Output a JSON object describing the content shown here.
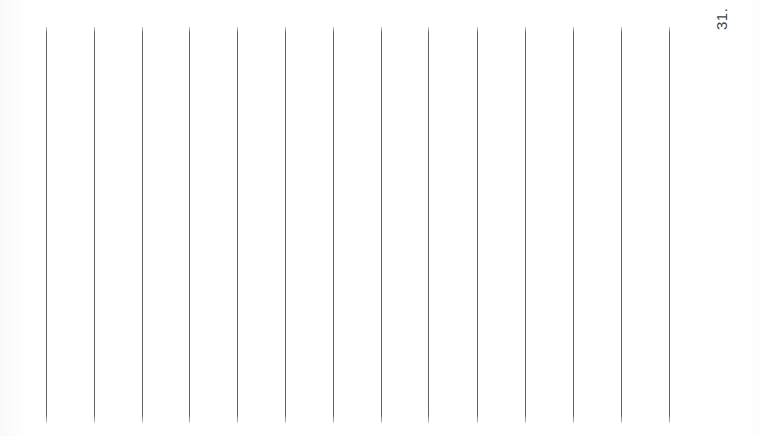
{
  "document": {
    "kind": "scanned-ruled-page",
    "orientation": "rotated-90-ccw",
    "page_number_label": "31.",
    "background_color": "#ffffff",
    "rule_color": "#5f6163",
    "page_number_color": "#44464a",
    "canvas": {
      "width": 761,
      "height": 436
    },
    "rules": {
      "count": 14,
      "line_width_px": 1,
      "orientation": "vertical-on-screen",
      "top_y": 27,
      "bottom_y": 423,
      "spacing_px": 48,
      "x_positions": [
        46,
        94,
        142,
        189,
        237,
        285,
        333,
        381,
        428,
        477,
        525,
        573,
        621,
        669
      ]
    },
    "page_number_position": {
      "x": 714,
      "y": 30
    }
  }
}
